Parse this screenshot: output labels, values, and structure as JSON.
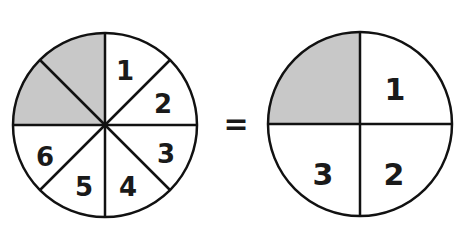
{
  "diagram": {
    "left_circle": {
      "total_parts": 8,
      "shaded_parts": 2,
      "labels": [
        "1",
        "2",
        "3",
        "4",
        "5",
        "6"
      ]
    },
    "equals_sign": "=",
    "right_circle": {
      "total_parts": 4,
      "shaded_parts": 1,
      "labels": [
        "1",
        "2",
        "3"
      ]
    },
    "colors": {
      "shade": "#c8c8c8",
      "stroke": "#111111",
      "background": "#ffffff"
    }
  }
}
